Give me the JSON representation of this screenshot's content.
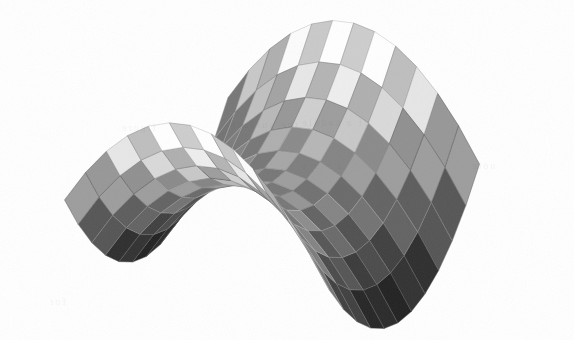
{
  "figure": {
    "kind": "3d-surface-plot",
    "title": "",
    "background_color": "#ffffff",
    "width": 574,
    "height": 340,
    "render_style": "checkerboard-shaded faceted mesh, grayscale, scanned halftone",
    "edge_color": "#8c8c8c",
    "edge_width": 0.45,
    "ghost_bleed_opacity": 0.055
  },
  "ghost_marks": [
    {
      "text": "the surface",
      "x": 228,
      "y": 118,
      "size": 11
    },
    {
      "text": "of a saddle",
      "x": 300,
      "y": 116,
      "size": 11
    },
    {
      "text": "figure",
      "x": 120,
      "y": 122,
      "size": 10
    },
    {
      "text": "z = x y",
      "x": 300,
      "y": 160,
      "size": 10
    },
    {
      "text": "67",
      "x": 382,
      "y": 300,
      "size": 12
    },
    {
      "text": "for",
      "x": 48,
      "y": 296,
      "size": 10
    },
    {
      "text": "note",
      "x": 470,
      "y": 160,
      "size": 10
    }
  ],
  "chart_data": {
    "type": "surface",
    "title": "",
    "xlabel": "",
    "ylabel": "",
    "zlabel": "",
    "surface_equation": "z = x^2 - y^2",
    "domain": {
      "u_min": -1.0,
      "u_max": 1.0,
      "v_min": -1.0,
      "v_max": 1.0
    },
    "grid": {
      "u_divisions": 12,
      "v_divisions": 12
    },
    "zlim": [
      -1.0,
      1.0
    ],
    "grid_lines": true,
    "legend": false,
    "axes_visible": false,
    "colormap": {
      "name": "grayscale",
      "stops": [
        "#151515",
        "#2a2a2a",
        "#3d3d3d",
        "#565656",
        "#6f6f6f",
        "#8a8a8a",
        "#a5a5a5",
        "#bfbfbf",
        "#d6d6d6",
        "#ececec",
        "#fafafa"
      ]
    },
    "checker_contrast": 0.14,
    "projection": {
      "type": "orthographic",
      "azimuth_deg": -57,
      "elevation_deg": 24,
      "roll_deg": 0,
      "scale_x": 150,
      "scale_y": 150,
      "scale_z": 118,
      "origin_x": 272,
      "origin_y": 182
    },
    "features": [
      {
        "name": "high-ridge-left",
        "screen_x": 150,
        "screen_y": 40,
        "tone": "near-white",
        "hex": "#f4f4f4"
      },
      {
        "name": "high-ridge-right",
        "screen_x": 498,
        "screen_y": 68,
        "tone": "light",
        "hex": "#dcdcdc"
      },
      {
        "name": "saddle-center",
        "screen_x": 300,
        "screen_y": 196,
        "tone": "mid-dark",
        "hex": "#636363"
      },
      {
        "name": "low-trough-front",
        "screen_x": 250,
        "screen_y": 300,
        "tone": "near-black",
        "hex": "#191919"
      },
      {
        "name": "low-trough-right",
        "screen_x": 430,
        "screen_y": 190,
        "tone": "very-dark",
        "hex": "#242424"
      }
    ],
    "bounding_box_px": {
      "left": 33,
      "top": 12,
      "right": 521,
      "bottom": 322
    }
  }
}
